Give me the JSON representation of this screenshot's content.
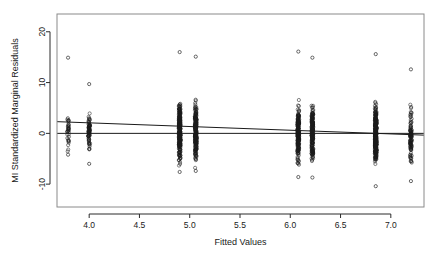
{
  "chart_data": {
    "type": "scatter",
    "title": "",
    "xlabel": "Fitted Values",
    "ylabel": "MI Standardized Marginal Residuals",
    "xlim": [
      3.68,
      7.33
    ],
    "ylim": [
      -14.5,
      23.5
    ],
    "grid": false,
    "legend": null,
    "xticks": [
      "4.0",
      "4.5",
      "5.0",
      "5.5",
      "6.0",
      "6.5",
      "7.0"
    ],
    "xtick_values": [
      4.0,
      4.5,
      5.0,
      5.5,
      6.0,
      6.5,
      7.0
    ],
    "yticks": [
      "-10",
      "0",
      "10",
      "20"
    ],
    "ytick_values": [
      -10,
      0,
      10,
      20
    ],
    "marker": "open-circle",
    "marker_color": "#1a1a1a",
    "marker_size": 1.6,
    "reference_line": {
      "name": "zero-line",
      "type": "horizontal",
      "y": 0,
      "color": "#1a1a1a",
      "width": 1
    },
    "trend_line": {
      "name": "smoother-line",
      "type": "linear",
      "x_start": 3.68,
      "y_start": 2.3,
      "x_end": 7.33,
      "y_end": -0.35,
      "color": "#1a1a1a",
      "width": 1
    },
    "clusters": [
      {
        "x": 3.79,
        "n": 34,
        "y_min": -4.2,
        "y_max": 14.9,
        "density_center": 0.2,
        "spread": 3.1
      },
      {
        "x": 4.0,
        "n": 70,
        "y_min": -6.0,
        "y_max": 9.7,
        "density_center": 0.0,
        "spread": 2.9
      },
      {
        "x": 4.9,
        "n": 260,
        "y_min": -7.6,
        "y_max": 16.0,
        "density_center": 0.4,
        "spread": 4.4
      },
      {
        "x": 5.06,
        "n": 230,
        "y_min": -7.4,
        "y_max": 15.1,
        "density_center": 0.2,
        "spread": 4.3
      },
      {
        "x": 6.08,
        "n": 210,
        "y_min": -8.6,
        "y_max": 16.1,
        "density_center": 0.0,
        "spread": 4.2
      },
      {
        "x": 6.22,
        "n": 200,
        "y_min": -8.7,
        "y_max": 14.9,
        "density_center": 0.0,
        "spread": 4.1
      },
      {
        "x": 6.85,
        "n": 300,
        "y_min": -10.4,
        "y_max": 15.6,
        "density_center": -0.4,
        "spread": 4.6
      },
      {
        "x": 7.2,
        "n": 95,
        "y_min": -9.4,
        "y_max": 12.6,
        "density_center": -0.4,
        "spread": 4.0
      }
    ]
  },
  "plot": {
    "box": {
      "left": 57,
      "top": 14,
      "right": 424,
      "bottom": 207
    },
    "box_color": "#8a8a8a",
    "axis_color": "#2b2b2b",
    "background": "#ffffff"
  }
}
